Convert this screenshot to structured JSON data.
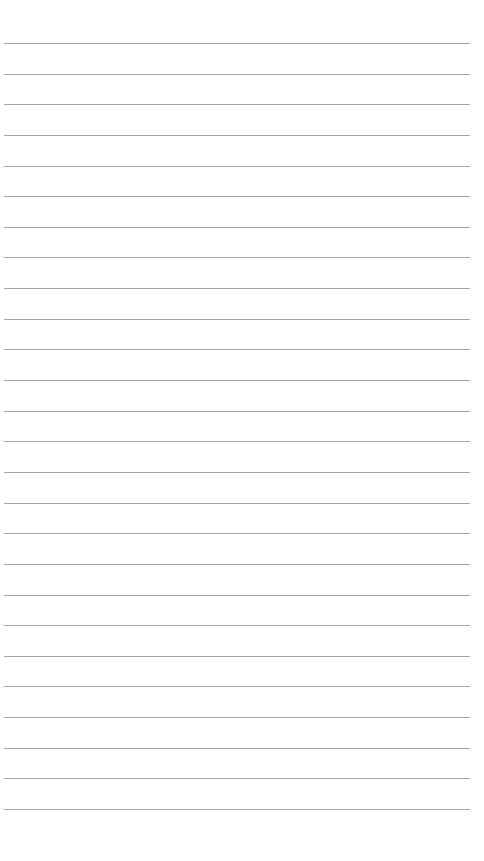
{
  "paper": {
    "type": "lined-paper",
    "line_count": 26,
    "first_line_y": 43,
    "line_spacing": 30.64,
    "line_left": 4,
    "line_width": 466,
    "line_color": "#a6a6a6",
    "background_color": "#ffffff"
  }
}
